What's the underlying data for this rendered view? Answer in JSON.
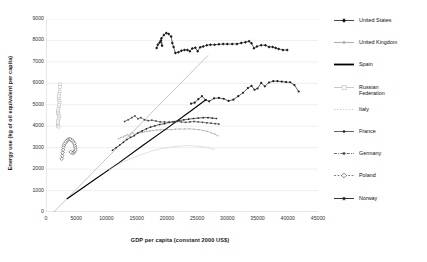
{
  "chart_data": {
    "type": "scatter",
    "title": "",
    "xlabel": "GDP per capita (constant 2000 US$)",
    "ylabel": "Energy use (kg of oil equivalent per capita)",
    "xlim": [
      0,
      45000
    ],
    "ylim": [
      0,
      9000
    ],
    "xticks": [
      0,
      5000,
      10000,
      15000,
      20000,
      25000,
      30000,
      35000,
      40000,
      45000
    ],
    "yticks": [
      0,
      1000,
      2000,
      3000,
      4000,
      5000,
      6000,
      7000,
      8000,
      9000
    ],
    "grid": "horizontal",
    "legend_position": "right",
    "series": [
      {
        "name": "United States",
        "color": "#1a1a1a",
        "marker": "diamond-filled",
        "points": [
          [
            18300,
            7650
          ],
          [
            18500,
            7800
          ],
          [
            18800,
            7900
          ],
          [
            19000,
            8000
          ],
          [
            19200,
            7750
          ],
          [
            19100,
            8100
          ],
          [
            19500,
            8250
          ],
          [
            19900,
            8350
          ],
          [
            20300,
            8300
          ],
          [
            20700,
            8180
          ],
          [
            20900,
            7880
          ],
          [
            21100,
            7700
          ],
          [
            21400,
            7420
          ],
          [
            21900,
            7450
          ],
          [
            22400,
            7520
          ],
          [
            22900,
            7560
          ],
          [
            23400,
            7560
          ],
          [
            23800,
            7500
          ],
          [
            24200,
            7620
          ],
          [
            24700,
            7660
          ],
          [
            25100,
            7500
          ],
          [
            25500,
            7680
          ],
          [
            26000,
            7720
          ],
          [
            26600,
            7780
          ],
          [
            27200,
            7800
          ],
          [
            27900,
            7800
          ],
          [
            28600,
            7820
          ],
          [
            29300,
            7830
          ],
          [
            30000,
            7830
          ],
          [
            30800,
            7830
          ],
          [
            31600,
            7840
          ],
          [
            32300,
            7880
          ],
          [
            33000,
            7920
          ],
          [
            33600,
            7960
          ],
          [
            34000,
            7870
          ],
          [
            34400,
            7640
          ],
          [
            34900,
            7720
          ],
          [
            35600,
            7780
          ],
          [
            36300,
            7780
          ],
          [
            36900,
            7700
          ],
          [
            37500,
            7700
          ],
          [
            38000,
            7650
          ],
          [
            38500,
            7600
          ],
          [
            39200,
            7560
          ],
          [
            39900,
            7550
          ]
        ]
      },
      {
        "name": "United Kingdom",
        "color": "#b0b0b0",
        "marker": "line-dot",
        "points": [
          [
            12000,
            3420
          ],
          [
            12400,
            3470
          ],
          [
            12800,
            3500
          ],
          [
            13100,
            3560
          ],
          [
            13500,
            3600
          ],
          [
            13800,
            3530
          ],
          [
            14000,
            3640
          ],
          [
            14300,
            3700
          ],
          [
            14700,
            3620
          ],
          [
            15100,
            3680
          ],
          [
            15500,
            3720
          ],
          [
            15900,
            3700
          ],
          [
            16300,
            3740
          ],
          [
            16700,
            3760
          ],
          [
            17200,
            3780
          ],
          [
            17700,
            3800
          ],
          [
            18300,
            3820
          ],
          [
            18900,
            3840
          ],
          [
            19500,
            3830
          ],
          [
            20100,
            3850
          ],
          [
            20700,
            3840
          ],
          [
            21400,
            3860
          ],
          [
            22100,
            3870
          ],
          [
            22900,
            3870
          ],
          [
            23700,
            3880
          ],
          [
            24500,
            3860
          ],
          [
            25300,
            3840
          ],
          [
            26000,
            3800
          ],
          [
            26700,
            3760
          ],
          [
            27300,
            3700
          ],
          [
            27900,
            3640
          ],
          [
            28400,
            3560
          ]
        ]
      },
      {
        "name": "Spain",
        "color": "#000000",
        "marker": "solid-line",
        "points": [
          [
            3500,
            620
          ],
          [
            8000,
            1500
          ],
          [
            12000,
            2280
          ],
          [
            16000,
            3100
          ],
          [
            20000,
            3900
          ],
          [
            24000,
            4720
          ],
          [
            26500,
            5250
          ]
        ]
      },
      {
        "name": "Russian Federation",
        "color": "#c4c4c4",
        "marker": "square-open",
        "points": [
          [
            2350,
            5950
          ],
          [
            2300,
            5820
          ],
          [
            2250,
            5620
          ],
          [
            2200,
            5500
          ],
          [
            2150,
            5400
          ],
          [
            2120,
            5250
          ],
          [
            2200,
            5180
          ],
          [
            2260,
            5100
          ],
          [
            2180,
            4980
          ],
          [
            2100,
            4880
          ],
          [
            2050,
            4800
          ],
          [
            2000,
            4700
          ],
          [
            1980,
            4620
          ],
          [
            2050,
            4560
          ],
          [
            2120,
            4500
          ],
          [
            2180,
            4420
          ],
          [
            2100,
            4340
          ],
          [
            2020,
            4260
          ],
          [
            1980,
            4180
          ],
          [
            1950,
            4080
          ],
          [
            2000,
            4020
          ],
          [
            2080,
            3980
          ]
        ]
      },
      {
        "name": "Italy",
        "color": "#c8c8c8",
        "marker": "dotted-line",
        "points": [
          [
            10500,
            1980
          ],
          [
            11200,
            2100
          ],
          [
            12000,
            2220
          ],
          [
            12800,
            2340
          ],
          [
            13500,
            2420
          ],
          [
            14200,
            2500
          ],
          [
            15000,
            2600
          ],
          [
            15800,
            2680
          ],
          [
            16600,
            2760
          ],
          [
            17400,
            2840
          ],
          [
            18200,
            2900
          ],
          [
            19100,
            2960
          ],
          [
            20000,
            3000
          ],
          [
            20900,
            3040
          ],
          [
            21800,
            3060
          ],
          [
            22700,
            3080
          ],
          [
            23600,
            3100
          ],
          [
            24400,
            3080
          ],
          [
            25200,
            3060
          ],
          [
            26000,
            3040
          ],
          [
            26700,
            3000
          ],
          [
            27300,
            2960
          ],
          [
            27900,
            2920
          ]
        ]
      },
      {
        "name": "France",
        "color": "#222222",
        "marker": "dot-small",
        "points": [
          [
            11000,
            2880
          ],
          [
            11600,
            3000
          ],
          [
            12200,
            3120
          ],
          [
            12800,
            3250
          ],
          [
            13400,
            3380
          ],
          [
            14000,
            3480
          ],
          [
            14600,
            3560
          ],
          [
            15200,
            3680
          ],
          [
            15900,
            3780
          ],
          [
            16600,
            3880
          ],
          [
            17300,
            3960
          ],
          [
            18000,
            4020
          ],
          [
            18800,
            4080
          ],
          [
            19600,
            4120
          ],
          [
            20400,
            4180
          ],
          [
            21200,
            4220
          ],
          [
            22000,
            4260
          ],
          [
            22800,
            4300
          ],
          [
            23600,
            4330
          ],
          [
            24400,
            4360
          ],
          [
            25200,
            4380
          ],
          [
            26000,
            4400
          ],
          [
            26800,
            4400
          ],
          [
            27500,
            4380
          ],
          [
            28200,
            4360
          ]
        ]
      },
      {
        "name": "Germany",
        "color": "#4a4a4a",
        "marker": "dash-dot",
        "points": [
          [
            13000,
            4220
          ],
          [
            13600,
            4300
          ],
          [
            14200,
            4400
          ],
          [
            14700,
            4480
          ],
          [
            15200,
            4350
          ],
          [
            15700,
            4400
          ],
          [
            16300,
            4300
          ],
          [
            16900,
            4260
          ],
          [
            17500,
            4280
          ],
          [
            18200,
            4240
          ],
          [
            18900,
            4200
          ],
          [
            19600,
            4200
          ],
          [
            20300,
            4180
          ],
          [
            21000,
            4200
          ],
          [
            21700,
            4220
          ],
          [
            22400,
            4200
          ],
          [
            23100,
            4180
          ],
          [
            23800,
            4200
          ],
          [
            24500,
            4220
          ],
          [
            25200,
            4200
          ],
          [
            25900,
            4180
          ],
          [
            26600,
            4160
          ],
          [
            27300,
            4140
          ],
          [
            28000,
            4120
          ],
          [
            28600,
            4100
          ]
        ]
      },
      {
        "name": "Poland",
        "color": "#555555",
        "marker": "diamond-open",
        "points": [
          [
            2600,
            2480
          ],
          [
            2700,
            2620
          ],
          [
            2750,
            2760
          ],
          [
            2820,
            2900
          ],
          [
            2900,
            3020
          ],
          [
            3000,
            3120
          ],
          [
            3150,
            3200
          ],
          [
            3300,
            3280
          ],
          [
            3500,
            3340
          ],
          [
            3700,
            3380
          ],
          [
            3900,
            3400
          ],
          [
            4100,
            3380
          ],
          [
            4350,
            3330
          ],
          [
            4550,
            3260
          ],
          [
            4700,
            3180
          ],
          [
            4800,
            3080
          ],
          [
            4850,
            2980
          ],
          [
            4820,
            2880
          ],
          [
            4700,
            2800
          ],
          [
            4500,
            2760
          ],
          [
            4300,
            2760
          ],
          [
            4100,
            2800
          ]
        ]
      },
      {
        "name": "Norway",
        "color": "#1f1f1f",
        "marker": "star-line",
        "points": [
          [
            24000,
            5050
          ],
          [
            24600,
            5100
          ],
          [
            25200,
            5260
          ],
          [
            25800,
            5400
          ],
          [
            26400,
            5220
          ],
          [
            27000,
            5160
          ],
          [
            27800,
            5300
          ],
          [
            28600,
            5320
          ],
          [
            29400,
            5280
          ],
          [
            30200,
            5180
          ],
          [
            31000,
            5240
          ],
          [
            31800,
            5400
          ],
          [
            32600,
            5560
          ],
          [
            33400,
            5780
          ],
          [
            34000,
            5880
          ],
          [
            34500,
            5700
          ],
          [
            35000,
            5760
          ],
          [
            35600,
            6020
          ],
          [
            36200,
            5860
          ],
          [
            36900,
            6040
          ],
          [
            37600,
            6100
          ],
          [
            38300,
            6100
          ],
          [
            39000,
            6080
          ],
          [
            39700,
            6060
          ],
          [
            40400,
            6050
          ],
          [
            41100,
            5920
          ],
          [
            41800,
            5620
          ]
        ]
      }
    ],
    "trendline": {
      "name": "linear-reference-line",
      "color": "#b5b5b5",
      "from": [
        1300,
        0
      ],
      "to": [
        26800,
        7300
      ]
    }
  },
  "legend": {
    "items": [
      {
        "label": "United States",
        "key": "diamond-filled"
      },
      {
        "label": "United Kingdom",
        "key": "line-dot"
      },
      {
        "label": "Spain",
        "key": "solid-line"
      },
      {
        "label": "Russian\nFederation",
        "key": "square-open"
      },
      {
        "label": "Italy",
        "key": "dotted-line"
      },
      {
        "label": "France",
        "key": "dot-small"
      },
      {
        "label": "Germany",
        "key": "dash-dot"
      },
      {
        "label": "Poland",
        "key": "diamond-open"
      },
      {
        "label": "Norway",
        "key": "star-line"
      }
    ]
  }
}
